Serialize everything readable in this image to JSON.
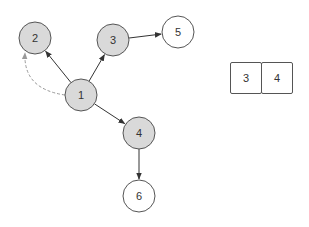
{
  "colors": {
    "filled_node": "#d9d9d9",
    "empty_node": "#ffffff",
    "stroke": "#555555",
    "edge": "#333333",
    "dashed_edge": "#999999"
  },
  "graph": {
    "nodes": [
      {
        "id": "1",
        "label": "1",
        "x": 81,
        "y": 95,
        "r": 16,
        "filled": true
      },
      {
        "id": "2",
        "label": "2",
        "x": 35,
        "y": 38,
        "r": 16,
        "filled": true
      },
      {
        "id": "3",
        "label": "3",
        "x": 113,
        "y": 40,
        "r": 16,
        "filled": true
      },
      {
        "id": "4",
        "label": "4",
        "x": 139,
        "y": 133,
        "r": 16,
        "filled": true
      },
      {
        "id": "5",
        "label": "5",
        "x": 178,
        "y": 32,
        "r": 16,
        "filled": false
      },
      {
        "id": "6",
        "label": "6",
        "x": 139,
        "y": 196,
        "r": 16,
        "filled": false
      }
    ],
    "edges": [
      {
        "from": "1",
        "to": "2",
        "style": "solid"
      },
      {
        "from": "1",
        "to": "3",
        "style": "solid"
      },
      {
        "from": "1",
        "to": "4",
        "style": "solid"
      },
      {
        "from": "3",
        "to": "5",
        "style": "solid"
      },
      {
        "from": "4",
        "to": "6",
        "style": "solid"
      },
      {
        "from": "1",
        "to": "2",
        "style": "dashed"
      }
    ]
  },
  "array": {
    "cells": [
      "3",
      "4"
    ]
  }
}
